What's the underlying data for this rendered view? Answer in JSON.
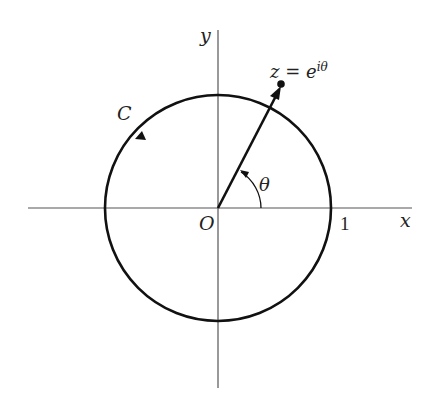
{
  "figure": {
    "labels": {
      "x_axis": "x",
      "y_axis": "y",
      "origin": "O",
      "one": "1",
      "curve": "C",
      "angle": "θ",
      "point_lhs": "z = e",
      "point_exp": "iθ"
    },
    "colors": {
      "stroke": "#111111",
      "axis": "#555555",
      "background": "#ffffff"
    },
    "geometry": {
      "center": [
        218,
        208
      ],
      "radius": 113,
      "angle_deg": 57,
      "orientation": "counterclockwise"
    }
  }
}
